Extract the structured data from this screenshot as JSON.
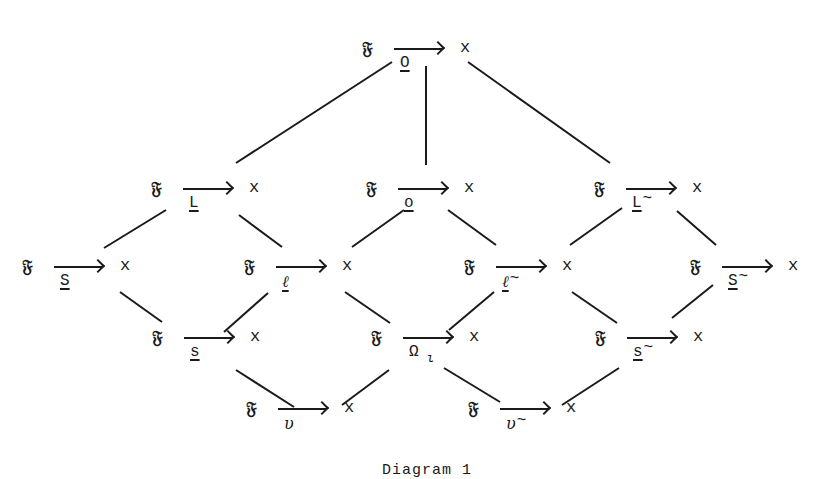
{
  "diagram": {
    "caption": "Diagram 1",
    "source_symbol": "𝔉",
    "target_symbol": "x",
    "nodes": [
      {
        "id": "O",
        "label": "O",
        "underline": true,
        "tilde": false,
        "x": 362,
        "y": 38
      },
      {
        "id": "L",
        "label": "L",
        "underline": true,
        "tilde": false,
        "x": 151,
        "y": 178
      },
      {
        "id": "o",
        "label": "o",
        "underline": true,
        "tilde": false,
        "x": 366,
        "y": 178
      },
      {
        "id": "L~",
        "label": "L",
        "underline": true,
        "tilde": true,
        "x": 594,
        "y": 178
      },
      {
        "id": "S",
        "label": "S",
        "underline": true,
        "tilde": false,
        "x": 22,
        "y": 256
      },
      {
        "id": "ell",
        "label": "ℓ",
        "underline": true,
        "tilde": false,
        "italic": true,
        "x": 244,
        "y": 256
      },
      {
        "id": "ell~",
        "label": "ℓ",
        "underline": true,
        "tilde": true,
        "italic": true,
        "x": 464,
        "y": 256
      },
      {
        "id": "S~",
        "label": "S",
        "underline": true,
        "tilde": true,
        "x": 690,
        "y": 256
      },
      {
        "id": "s",
        "label": "s",
        "underline": true,
        "tilde": false,
        "x": 152,
        "y": 327
      },
      {
        "id": "Omega_iota",
        "label": "Ω",
        "subscript": "ι",
        "underline": false,
        "tilde": false,
        "x": 371,
        "y": 327
      },
      {
        "id": "s~",
        "label": "s",
        "underline": true,
        "tilde": true,
        "x": 595,
        "y": 327
      },
      {
        "id": "upsilon",
        "label": "υ",
        "underline": false,
        "tilde": false,
        "italic": true,
        "x": 246,
        "y": 398
      },
      {
        "id": "upsilon~",
        "label": "υ",
        "underline": false,
        "tilde": true,
        "italic": true,
        "x": 468,
        "y": 398
      }
    ],
    "edges": [
      {
        "from": "O",
        "to": "L",
        "x1": 392,
        "y1": 62,
        "x2": 236,
        "y2": 163
      },
      {
        "from": "O",
        "to": "o",
        "x1": 426,
        "y1": 66,
        "x2": 426,
        "y2": 165
      },
      {
        "from": "O",
        "to": "L~",
        "x1": 468,
        "y1": 62,
        "x2": 610,
        "y2": 163
      },
      {
        "from": "L",
        "to": "S",
        "x1": 166,
        "y1": 210,
        "x2": 104,
        "y2": 248
      },
      {
        "from": "L",
        "to": "ell",
        "x1": 239,
        "y1": 215,
        "x2": 282,
        "y2": 247
      },
      {
        "from": "o",
        "to": "ell",
        "x1": 404,
        "y1": 210,
        "x2": 352,
        "y2": 247
      },
      {
        "from": "o",
        "to": "ell~",
        "x1": 448,
        "y1": 210,
        "x2": 496,
        "y2": 245
      },
      {
        "from": "L~",
        "to": "ell~",
        "x1": 622,
        "y1": 208,
        "x2": 570,
        "y2": 245
      },
      {
        "from": "L~",
        "to": "S~",
        "x1": 677,
        "y1": 211,
        "x2": 716,
        "y2": 245
      },
      {
        "from": "S",
        "to": "s",
        "x1": 120,
        "y1": 292,
        "x2": 162,
        "y2": 322
      },
      {
        "from": "ell",
        "to": "s",
        "x1": 268,
        "y1": 293,
        "x2": 224,
        "y2": 332
      },
      {
        "from": "ell",
        "to": "Omega_iota",
        "x1": 345,
        "y1": 292,
        "x2": 390,
        "y2": 323
      },
      {
        "from": "ell~",
        "to": "Omega_iota",
        "x1": 494,
        "y1": 292,
        "x2": 449,
        "y2": 330
      },
      {
        "from": "ell~",
        "to": "s~",
        "x1": 572,
        "y1": 292,
        "x2": 617,
        "y2": 323
      },
      {
        "from": "S~",
        "to": "s~",
        "x1": 713,
        "y1": 285,
        "x2": 672,
        "y2": 318
      },
      {
        "from": "s",
        "to": "upsilon",
        "x1": 236,
        "y1": 370,
        "x2": 294,
        "y2": 407
      },
      {
        "from": "Omega_iota",
        "to": "upsilon",
        "x1": 389,
        "y1": 370,
        "x2": 342,
        "y2": 405
      },
      {
        "from": "Omega_iota",
        "to": "upsilon~",
        "x1": 444,
        "y1": 368,
        "x2": 500,
        "y2": 402
      },
      {
        "from": "s~",
        "to": "upsilon~",
        "x1": 619,
        "y1": 368,
        "x2": 562,
        "y2": 405
      }
    ]
  }
}
